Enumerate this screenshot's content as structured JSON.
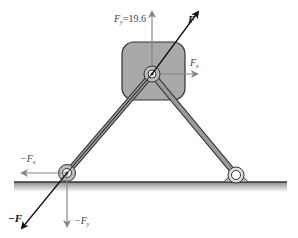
{
  "diagram": {
    "type": "force-diagram",
    "labels": {
      "F": "F",
      "minus_F": "−F",
      "Fy_top": {
        "symbol": "F",
        "sub": "y",
        "value": "=19.6"
      },
      "Fx_top": {
        "symbol": "F",
        "sub": "x"
      },
      "minus_Fx": {
        "symbol": "−F",
        "sub": "x"
      },
      "minus_Fy": {
        "symbol": "−F",
        "sub": "y"
      }
    },
    "colors": {
      "block_fill": "#a9a9a9",
      "block_stroke": "#333333",
      "bar_fill": "#9a9a9a",
      "bar_stroke": "#333333",
      "force_arrow": "#111111",
      "component_arrow": "#888888",
      "ground": "#333333"
    },
    "points": {
      "top_pivot": [
        152,
        74
      ],
      "left_pin": [
        67,
        173
      ],
      "right_pin": [
        236,
        175
      ],
      "ground_y": 182
    }
  }
}
